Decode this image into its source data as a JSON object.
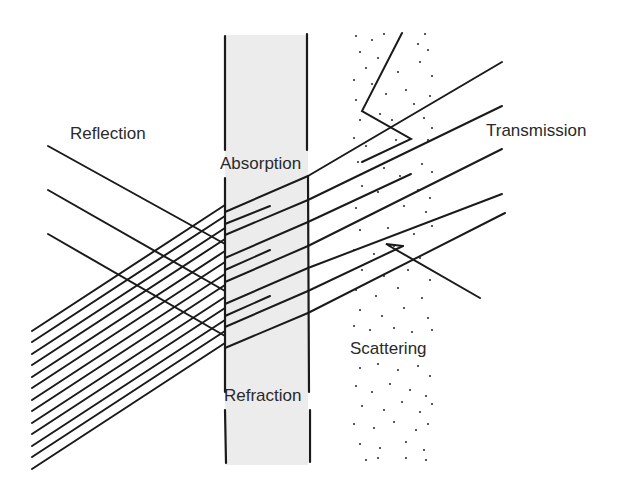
{
  "diagram": {
    "labels": {
      "reflection": "Reflection",
      "absorption": "Absorption",
      "transmission": "Transmission",
      "scattering": "Scattering",
      "refraction": "Refraction"
    },
    "colors": {
      "ink": "#1a1a1a",
      "slab_fill": "#ececec",
      "background": "#ffffff"
    },
    "slab": {
      "left_x": 225,
      "right_x": 308,
      "top_y": 35,
      "bottom_y": 465
    },
    "scattering_medium": {
      "left_x": 352,
      "right_x": 434,
      "top_y": 30,
      "bottom_y": 465
    }
  }
}
